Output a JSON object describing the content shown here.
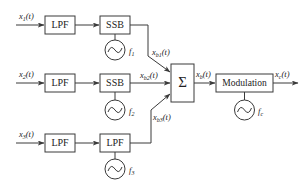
{
  "diagram": {
    "inputs": [
      {
        "label": "x",
        "sub": "1",
        "arg": "(t)"
      },
      {
        "label": "x",
        "sub": "2",
        "arg": "(t)"
      },
      {
        "label": "x",
        "sub": "3",
        "arg": "(t)"
      }
    ],
    "rows": [
      {
        "filter": "LPF",
        "modulator": "SSB",
        "osc_label": "f",
        "osc_sub": "1",
        "out_label": "x",
        "out_sub": "b1",
        "out_arg": "(t)"
      },
      {
        "filter": "LPF",
        "modulator": "SSB",
        "osc_label": "f",
        "osc_sub": "2",
        "out_label": "x",
        "out_sub": "b2",
        "out_arg": "(t)"
      },
      {
        "filter": "LPF",
        "modulator": "LPF",
        "osc_label": "f",
        "osc_sub": "3",
        "out_label": "x",
        "out_sub": "b3",
        "out_arg": "(t)"
      }
    ],
    "summer": {
      "symbol": "Σ"
    },
    "sum_output": {
      "label": "x",
      "sub": "b",
      "arg": "(t)"
    },
    "modulation": {
      "label": "Modulation",
      "osc_label": "f",
      "osc_sub": "c"
    },
    "output": {
      "label": "x",
      "sub": "c",
      "arg": "(t)"
    },
    "colors": {
      "stroke": "#3a3a3a",
      "text": "#222222",
      "background": "#ffffff"
    }
  }
}
